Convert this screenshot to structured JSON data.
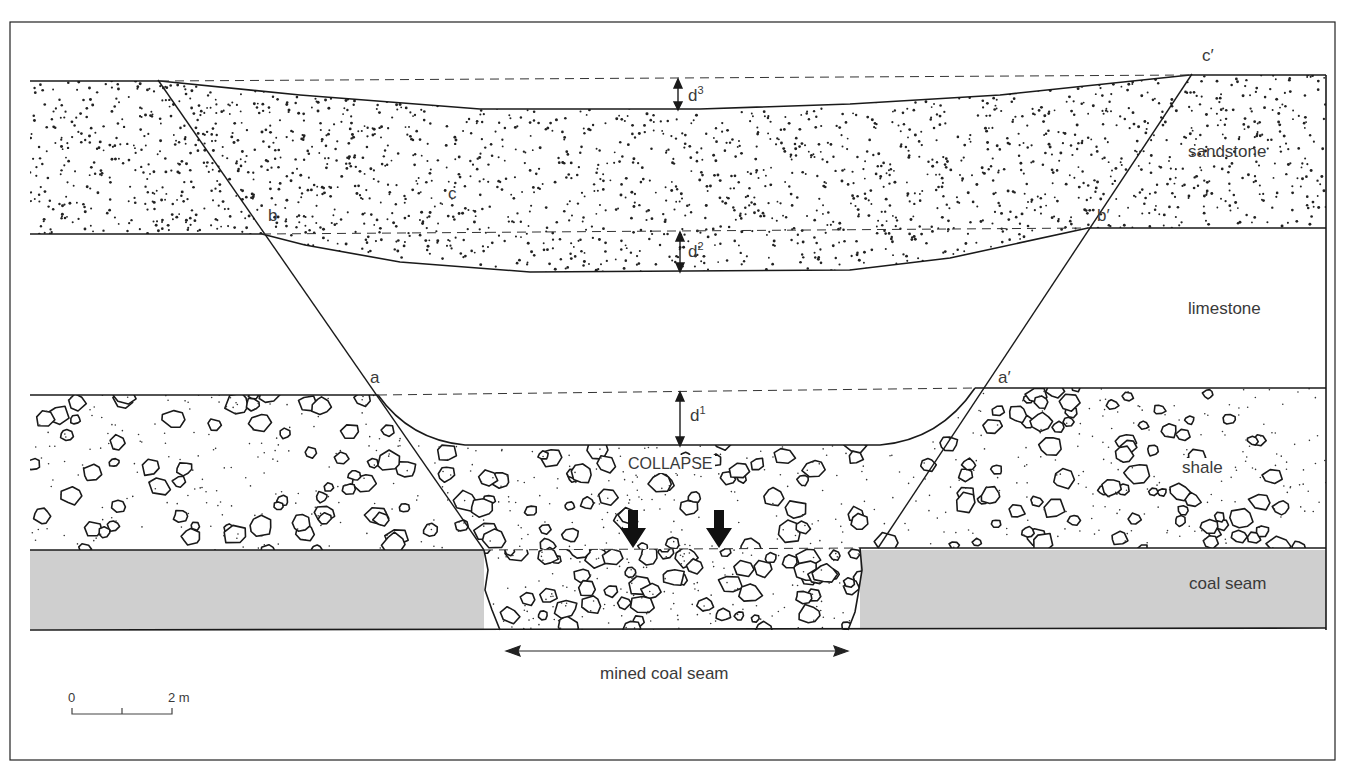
{
  "diagram": {
    "type": "geological cross-section",
    "frame_color": "#222222",
    "coal_fill": "#cfcfcf",
    "layers": [
      {
        "id": "sandstone",
        "label": "sandstone",
        "pattern": "fine dots"
      },
      {
        "id": "limestone",
        "label": "limestone",
        "pattern": "blank"
      },
      {
        "id": "shale",
        "label": "shale",
        "pattern": "pebbles and dots"
      },
      {
        "id": "coal",
        "label": "coal seam",
        "pattern": "grey fill"
      }
    ],
    "points": {
      "a": "a",
      "a_prime": "a′",
      "b": "b",
      "b_prime": "b′",
      "c": "c",
      "c_prime": "c′"
    },
    "displacements": {
      "d1": {
        "base": "d",
        "sup": "1"
      },
      "d2": {
        "base": "d",
        "sup": "2"
      },
      "d3": {
        "base": "d",
        "sup": "3"
      }
    },
    "collapse_label": "COLLAPSE",
    "mined_label": "mined coal seam",
    "scale_bar": {
      "start": "0",
      "end": "2 m"
    }
  }
}
